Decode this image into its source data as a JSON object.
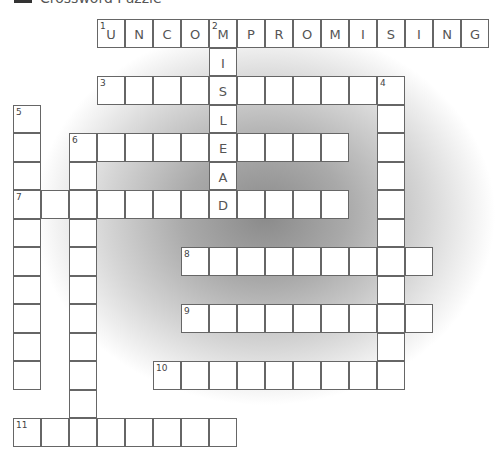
{
  "header": {
    "title_fragment": "Crossword Puzzle"
  },
  "grid": {
    "origin_x": 97,
    "origin_y": 19,
    "cell_w": 28,
    "cell_h": 28.5
  },
  "entries": [
    {
      "number": "1",
      "direction": "across",
      "col": 0,
      "row": 0,
      "length": 14,
      "answer": "UNCOMPROMISING"
    },
    {
      "number": "2",
      "direction": "down",
      "col": 4,
      "row": 0,
      "length": 7,
      "answer": "MISLEAD"
    },
    {
      "number": "3",
      "direction": "across",
      "col": 0,
      "row": 2,
      "length": 11,
      "answer": ""
    },
    {
      "number": "4",
      "direction": "down",
      "col": 10,
      "row": 2,
      "length": 11,
      "answer": ""
    },
    {
      "number": "5",
      "direction": "down",
      "col": -3,
      "row": 3,
      "length": 10,
      "answer": ""
    },
    {
      "number": "6",
      "direction": "across",
      "col": -1,
      "row": 4,
      "length": 10,
      "answer": ""
    },
    {
      "number": "6",
      "direction": "down",
      "col": -1,
      "row": 4,
      "length": 11,
      "answer": ""
    },
    {
      "number": "7",
      "direction": "across",
      "col": -3,
      "row": 6,
      "length": 12,
      "answer": ""
    },
    {
      "number": "8",
      "direction": "across",
      "col": 3,
      "row": 8,
      "length": 9,
      "answer": ""
    },
    {
      "number": "9",
      "direction": "across",
      "col": 3,
      "row": 10,
      "length": 9,
      "answer": ""
    },
    {
      "number": "10",
      "direction": "across",
      "col": 2,
      "row": 12,
      "length": 9,
      "answer": ""
    },
    {
      "number": "11",
      "direction": "across",
      "col": -3,
      "row": 14,
      "length": 8,
      "answer": ""
    }
  ]
}
